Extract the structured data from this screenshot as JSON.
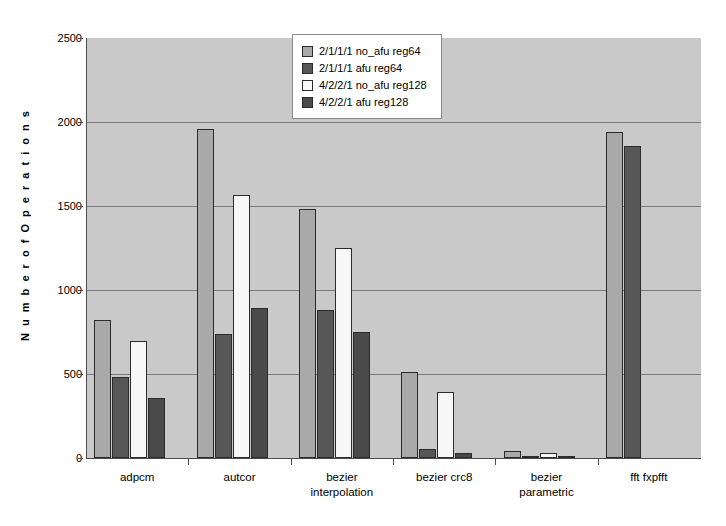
{
  "chart_data": {
    "type": "bar",
    "title": "",
    "xlabel": "",
    "ylabel": "N u m b e r   o f   O p e r a t i o n s",
    "ylim": [
      0,
      2500
    ],
    "yticks": [
      0,
      500,
      1000,
      1500,
      2000,
      2500
    ],
    "grid": true,
    "legend_position": "top-center",
    "categories": [
      "adpcm",
      "autcor",
      "bezier\ninterpolation",
      "bezier crc8",
      "bezier\nparametric",
      "fft fxpfft"
    ],
    "series": [
      {
        "name": "2/1/1/1 no_afu reg64",
        "color": "#a9a9a9",
        "values": [
          820,
          1960,
          1485,
          510,
          40,
          1940
        ]
      },
      {
        "name": "2/1/1/1 afu reg64",
        "color": "#575757",
        "values": [
          485,
          740,
          880,
          55,
          10,
          1855
        ]
      },
      {
        "name": "4/2/2/1 no_afu reg128",
        "color": "#f7f7f7",
        "values": [
          695,
          1565,
          1250,
          390,
          30,
          0
        ]
      },
      {
        "name": "4/2/2/1 afu reg128",
        "color": "#4a4a4a",
        "values": [
          355,
          890,
          750,
          30,
          8,
          0
        ]
      }
    ]
  },
  "axes": {
    "y_title": "N u m b e r  o f  O p e r a t i o n s",
    "tick_labels": [
      "2500",
      "2000",
      "1500",
      "1000",
      "500",
      "0"
    ]
  },
  "legend": {
    "items": [
      {
        "label": "2/1/1/1 no_afu reg64"
      },
      {
        "label": "2/1/1/1 afu reg64"
      },
      {
        "label": "4/2/2/1 no_afu reg128"
      },
      {
        "label": "4/2/2/1 afu reg128"
      }
    ]
  },
  "colors": {
    "plot_background": "#c9c9c9",
    "page_background": "#ffffff",
    "gridline": "#7b7b7b",
    "axis": "#4c4c4c",
    "bar_border": "#2b2b2b"
  }
}
